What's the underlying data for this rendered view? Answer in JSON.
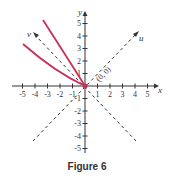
{
  "figure": {
    "caption": "Figure 6",
    "axes": {
      "x_label": "x",
      "y_label": "y",
      "u_label": "u",
      "v_label": "v",
      "x_ticks": [
        "-5",
        "-4",
        "-3",
        "-2",
        "-1",
        "1",
        "2",
        "3",
        "4",
        "5"
      ],
      "y_ticks": [
        "5",
        "4",
        "3",
        "2",
        "1",
        "-1",
        "-2",
        "-3",
        "-4",
        "-5"
      ]
    },
    "origin_label": "(0, 0)",
    "curve_color": "#c8305a",
    "axis_color": "#333333"
  }
}
